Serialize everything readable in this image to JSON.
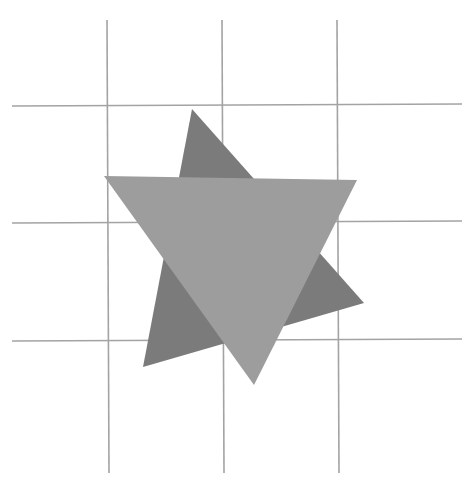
{
  "diagram": {
    "background": "#ffffff",
    "grid": {
      "color": "#a3a3a3",
      "stroke_width": 1.6,
      "vertical_lines": [
        {
          "x1": 107,
          "y1": 20,
          "x2": 109,
          "y2": 473
        },
        {
          "x1": 222,
          "y1": 20,
          "x2": 224,
          "y2": 473
        },
        {
          "x1": 337,
          "y1": 20,
          "x2": 339,
          "y2": 473
        }
      ],
      "horizontal_lines": [
        {
          "x1": 12,
          "y1": 106,
          "x2": 462,
          "y2": 104
        },
        {
          "x1": 12,
          "y1": 223,
          "x2": 462,
          "y2": 221
        },
        {
          "x1": 12,
          "y1": 341,
          "x2": 462,
          "y2": 339
        }
      ]
    },
    "shapes": [
      {
        "name": "dark-triangle",
        "fill": "#7b7b7b",
        "points": [
          [
            192,
            109
          ],
          [
            364,
            303
          ],
          [
            143,
            367
          ]
        ]
      },
      {
        "name": "light-triangle",
        "fill": "#9d9d9d",
        "points": [
          [
            104,
            176
          ],
          [
            357,
            180
          ],
          [
            254,
            385
          ]
        ]
      }
    ]
  }
}
